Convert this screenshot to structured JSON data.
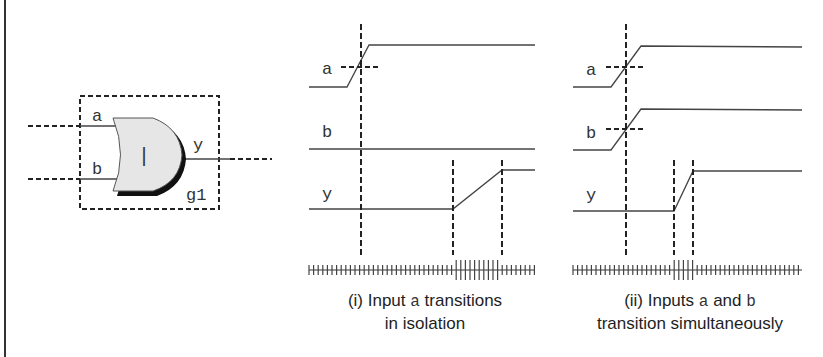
{
  "gate": {
    "type": "OR",
    "symbol": "|",
    "name": "g1",
    "inputs": [
      "a",
      "b"
    ],
    "output": "y",
    "fill_color": "#e6e6e6",
    "shadow_color": "#111111"
  },
  "panel_i": {
    "signals": {
      "a": "a",
      "b": "b",
      "y": "y"
    },
    "caption": {
      "prefix": "(i) Input",
      "code": "a",
      "suffix": "transitions",
      "line2": "in isolation"
    },
    "description": "Input a rises while b stays high-level constant; output y rises after a longer delay"
  },
  "panel_ii": {
    "signals": {
      "a": "a",
      "b": "b",
      "y": "y"
    },
    "caption": {
      "prefix": "(ii) Inputs",
      "code_a": "a",
      "mid": "and",
      "code_b": "b",
      "line2": "transition simultaneously"
    },
    "description": "Inputs a and b rise simultaneously; output y rises after a shorter delay"
  },
  "colors": {
    "line": "#333333",
    "dash": "#222222",
    "border": "#333333"
  }
}
